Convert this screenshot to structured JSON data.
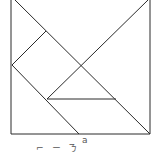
{
  "diagram": {
    "type": "tangram",
    "stroke_color": "#2a2a2a",
    "background": "#ffffff",
    "pieces": [
      {
        "name": "large-triangle-top",
        "points": [
          [
            11,
            -3
          ],
          [
            150,
            -3
          ],
          [
            81,
            65
          ]
        ]
      },
      {
        "name": "large-triangle-right",
        "points": [
          [
            150,
            -3
          ],
          [
            150,
            134
          ],
          [
            81,
            65
          ]
        ]
      },
      {
        "name": "small-triangle-left-top",
        "points": [
          [
            11,
            -3
          ],
          [
            46,
            31
          ],
          [
            11,
            65
          ]
        ]
      },
      {
        "name": "square",
        "points": [
          [
            46,
            31
          ],
          [
            81,
            65
          ],
          [
            47,
            99
          ],
          [
            12,
            65
          ]
        ]
      },
      {
        "name": "parallelogram",
        "points": [
          [
            12,
            65
          ],
          [
            47,
            99
          ],
          [
            79,
            134
          ],
          [
            11,
            134
          ]
        ]
      },
      {
        "name": "medium-triangle",
        "points": [
          [
            47,
            99
          ],
          [
            116,
            99
          ],
          [
            81,
            65
          ]
        ]
      },
      {
        "name": "small-triangle-bottom",
        "points": [
          [
            47,
            99
          ],
          [
            116,
            99
          ],
          [
            150,
            134
          ],
          [
            79,
            134
          ]
        ]
      }
    ]
  },
  "caption": {
    "label_a": "a",
    "partial_chars": [
      "⌐",
      "ㄧ",
      "ㄋ"
    ]
  }
}
